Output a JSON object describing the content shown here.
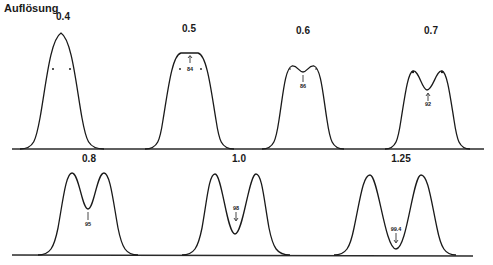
{
  "figure": {
    "title": "Auflösung",
    "rows": [
      {
        "panels": [
          {
            "resolution": "0.4",
            "dip_value": null,
            "shape": "single-peak"
          },
          {
            "resolution": "0.5",
            "dip_value": "84",
            "shape": "flat-top"
          },
          {
            "resolution": "0.6",
            "dip_value": "86",
            "shape": "shallow-double"
          },
          {
            "resolution": "0.7",
            "dip_value": "92",
            "shape": "double"
          }
        ]
      },
      {
        "panels": [
          {
            "resolution": "0.8",
            "dip_value": "95",
            "shape": "double"
          },
          {
            "resolution": "1.0",
            "dip_value": "98",
            "shape": "double"
          },
          {
            "resolution": "1.25",
            "dip_value": "99.4",
            "shape": "double"
          }
        ]
      }
    ],
    "colors": {
      "line": "#1a1a1a",
      "background": "#ffffff"
    }
  }
}
